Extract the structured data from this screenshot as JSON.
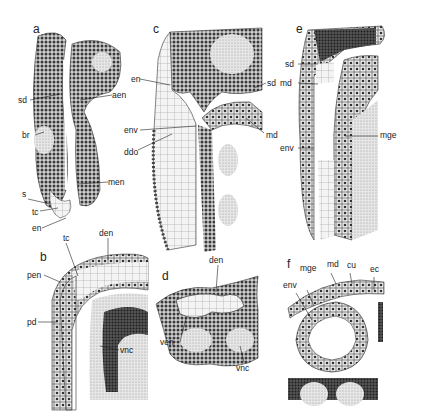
{
  "figure": {
    "type": "histological drawing plate",
    "panels": [
      {
        "id": "a",
        "letter": "a",
        "labels": [
          "sd",
          "aen",
          "br",
          "men",
          "s",
          "tc",
          "en"
        ]
      },
      {
        "id": "b",
        "letter": "b",
        "labels": [
          "tc",
          "den",
          "pen",
          "pd",
          "vnc"
        ]
      },
      {
        "id": "c",
        "letter": "c",
        "labels": [
          "en",
          "sd",
          "env",
          "md",
          "ddo"
        ]
      },
      {
        "id": "d",
        "letter": "d",
        "labels": [
          "den",
          "ven",
          "vnc"
        ]
      },
      {
        "id": "e",
        "letter": "e",
        "labels": [
          "sd",
          "md",
          "mge",
          "env"
        ]
      },
      {
        "id": "f",
        "letter": "f",
        "labels": [
          "mge",
          "md",
          "cu",
          "ec",
          "env"
        ]
      }
    ]
  },
  "labels": {
    "a_letter": "a",
    "a_sd": "sd",
    "a_aen": "aen",
    "a_br": "br",
    "a_men": "men",
    "a_s": "s",
    "a_tc": "tc",
    "a_en": "en",
    "b_letter": "b",
    "b_tc": "tc",
    "b_den": "den",
    "b_pen": "pen",
    "b_pd": "pd",
    "b_vnc": "vnc",
    "c_letter": "c",
    "c_en": "en",
    "c_sd": "sd",
    "c_env": "env",
    "c_md": "md",
    "c_ddo": "ddo",
    "d_letter": "d",
    "d_den": "den",
    "d_ven": "ven",
    "d_vnc": "vnc",
    "e_letter": "e",
    "e_sd": "sd",
    "e_md": "md",
    "e_mge": "mge",
    "e_env": "env",
    "f_letter": "f",
    "f_mge": "mge",
    "f_md": "md",
    "f_cu": "cu",
    "f_ec": "ec",
    "f_env": "env"
  }
}
